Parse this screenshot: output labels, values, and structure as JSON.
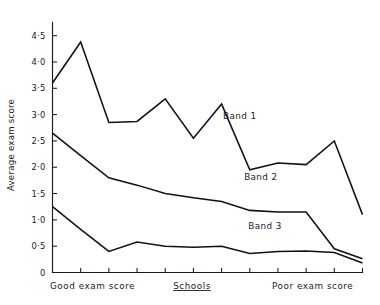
{
  "chart_data": {
    "type": "line",
    "title": "",
    "xlabel": "Schools",
    "ylabel": "Average exam score",
    "xlabel_left": "Good exam score",
    "xlabel_right": "Poor exam score",
    "grid": false,
    "legend_position": "inline-labels",
    "ylim": [
      0,
      4.75
    ],
    "yticks": [
      0,
      0.5,
      1.0,
      1.5,
      2.0,
      2.5,
      3.0,
      3.5,
      4.0,
      4.5
    ],
    "ytick_labels": [
      "0",
      "0·5",
      "1·0",
      "1·5",
      "2·0",
      "2·5",
      "3·0",
      "3·5",
      "4·0",
      "4·5"
    ],
    "x": [
      1,
      2,
      3,
      4,
      5,
      6,
      7,
      8,
      9,
      10,
      11,
      12
    ],
    "n_xticks": 12,
    "series": [
      {
        "name": "Band 1",
        "label": "Band 1",
        "values": [
          3.6,
          4.38,
          2.85,
          2.87,
          3.3,
          2.55,
          3.2,
          1.95,
          2.08,
          2.05,
          2.5,
          1.1
        ],
        "label_x": 6.05,
        "label_y": 2.92
      },
      {
        "name": "Band 2",
        "label": "Band 2",
        "values": [
          2.65,
          2.22,
          1.8,
          1.66,
          1.5,
          1.42,
          1.35,
          1.18,
          1.15,
          1.15,
          0.45,
          0.26
        ],
        "label_x": 6.8,
        "label_y": 1.75
      },
      {
        "name": "Band 3",
        "label": "Band 3",
        "values": [
          1.25,
          0.82,
          0.4,
          0.58,
          0.5,
          0.48,
          0.5,
          0.36,
          0.4,
          0.41,
          0.38,
          0.18
        ],
        "label_x": 6.95,
        "label_y": 0.82
      }
    ]
  }
}
